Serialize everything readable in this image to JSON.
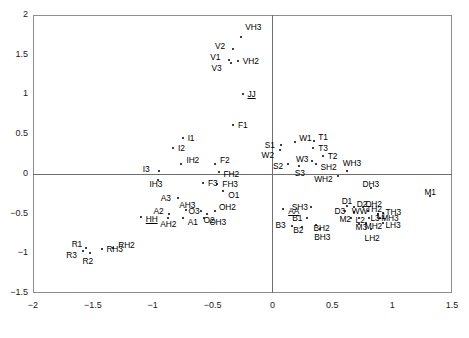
{
  "chart_data": {
    "type": "scatter",
    "title": "",
    "subtitle": "",
    "xlabel": "",
    "ylabel": "",
    "xlim": [
      -2,
      1.5
    ],
    "ylim": [
      -1.5,
      2
    ],
    "grid": false,
    "legend": "none",
    "xticks": [
      "-2",
      "-1.5",
      "-1",
      "-0.5",
      "0",
      "0.5",
      "1",
      "1.5"
    ],
    "xtick_values": [
      -2,
      -1.5,
      -1,
      -0.5,
      0,
      0.5,
      1,
      1.5
    ],
    "yticks": [
      "2",
      "1.5",
      "1",
      "0.5",
      "0",
      "-0.5",
      "-1",
      "-1.5"
    ],
    "ytick_values": [
      2,
      1.5,
      1,
      0.5,
      0,
      -0.5,
      -1,
      -1.5
    ],
    "reference_lines": [
      {
        "axis": "x",
        "value": 0
      },
      {
        "axis": "y",
        "value": 0
      }
    ],
    "marker": "dot",
    "point_color": "#000000",
    "frame_color": "#8d8d8d",
    "points": [
      {
        "label": "VH3",
        "x": -0.26,
        "y": 1.72,
        "lx": 4,
        "ly": -11
      },
      {
        "label": "V2",
        "x": -0.33,
        "y": 1.57,
        "lx": -18,
        "ly": -4
      },
      {
        "label": "V1",
        "x": -0.36,
        "y": 1.43,
        "lx": -19,
        "ly": -4
      },
      {
        "label": "V3",
        "x": -0.35,
        "y": 1.4,
        "lx": -19,
        "ly": 4
      },
      {
        "label": "VH2",
        "x": -0.29,
        "y": 1.42,
        "lx": 5,
        "ly": -1
      },
      {
        "label": "JJ",
        "x": -0.25,
        "y": 1.0,
        "lx": 5,
        "ly": -1,
        "underline": true
      },
      {
        "label": "F1",
        "x": -0.33,
        "y": 0.62,
        "lx": 5,
        "ly": -1
      },
      {
        "label": "I1",
        "x": -0.75,
        "y": 0.45,
        "lx": 5,
        "ly": -1
      },
      {
        "label": "I2",
        "x": -0.83,
        "y": 0.33,
        "lx": 5,
        "ly": -1
      },
      {
        "label": "IH2",
        "x": -0.76,
        "y": 0.12,
        "lx": 5,
        "ly": -5
      },
      {
        "label": "F2",
        "x": -0.48,
        "y": 0.13,
        "lx": 5,
        "ly": -5
      },
      {
        "label": "I3",
        "x": -0.95,
        "y": 0.04,
        "lx": -16,
        "ly": -3
      },
      {
        "label": "FH2",
        "x": -0.45,
        "y": 0.02,
        "lx": 5,
        "ly": 1
      },
      {
        "label": "IH3",
        "x": -0.96,
        "y": -0.08,
        "lx": -8,
        "ly": 3
      },
      {
        "label": "F3",
        "x": -0.58,
        "y": -0.12,
        "lx": 5,
        "ly": -1
      },
      {
        "label": "FH3",
        "x": -0.46,
        "y": -0.13,
        "lx": 5,
        "ly": -1
      },
      {
        "label": "O1",
        "x": -0.41,
        "y": -0.22,
        "lx": 5,
        "ly": 3
      },
      {
        "label": "A3",
        "x": -0.79,
        "y": -0.31,
        "lx": -17,
        "ly": -1
      },
      {
        "label": "AH3",
        "x": -0.72,
        "y": -0.45,
        "lx": -7,
        "ly": -6
      },
      {
        "label": "O3",
        "x": -0.6,
        "y": -0.47,
        "lx": -12,
        "ly": -1
      },
      {
        "label": "O2",
        "x": -0.55,
        "y": -0.5,
        "lx": -3,
        "ly": 5
      },
      {
        "label": "OH2",
        "x": -0.48,
        "y": -0.47,
        "lx": 4,
        "ly": -5
      },
      {
        "label": "A2",
        "x": -0.86,
        "y": -0.5,
        "lx": -16,
        "ly": -4
      },
      {
        "label": "AH2",
        "x": -0.87,
        "y": -0.55,
        "lx": -8,
        "ly": 5
      },
      {
        "label": "A1",
        "x": -0.75,
        "y": -0.55,
        "lx": 5,
        "ly": 3
      },
      {
        "label": "OH3",
        "x": -0.57,
        "y": -0.56,
        "lx": 5,
        "ly": 3
      },
      {
        "label": "HH",
        "x": -1.1,
        "y": -0.54,
        "lx": 5,
        "ly": 1,
        "underline": true
      },
      {
        "label": "R1",
        "x": -1.56,
        "y": -0.93,
        "lx": -14,
        "ly": -5
      },
      {
        "label": "R3",
        "x": -1.58,
        "y": -0.97,
        "lx": -17,
        "ly": 3
      },
      {
        "label": "R2",
        "x": -1.52,
        "y": -1.0,
        "lx": -8,
        "ly": 7
      },
      {
        "label": "RH3",
        "x": -1.42,
        "y": -0.95,
        "lx": 4,
        "ly": -1
      },
      {
        "label": "RH2",
        "x": -1.33,
        "y": -0.93,
        "lx": 5,
        "ly": -4
      },
      {
        "label": "S1",
        "x": 0.07,
        "y": 0.36,
        "lx": -16,
        "ly": -1
      },
      {
        "label": "W2",
        "x": 0.06,
        "y": 0.3,
        "lx": -18,
        "ly": 4
      },
      {
        "label": "W1",
        "x": 0.19,
        "y": 0.4,
        "lx": 4,
        "ly": -5
      },
      {
        "label": "T1",
        "x": 0.35,
        "y": 0.41,
        "lx": 4,
        "ly": -5
      },
      {
        "label": "T3",
        "x": 0.34,
        "y": 0.33,
        "lx": 5,
        "ly": -1
      },
      {
        "label": "T2",
        "x": 0.42,
        "y": 0.22,
        "lx": 5,
        "ly": -1
      },
      {
        "label": "W3",
        "x": 0.33,
        "y": 0.16,
        "lx": -16,
        "ly": -3
      },
      {
        "label": "SH2",
        "x": 0.36,
        "y": 0.12,
        "lx": 5,
        "ly": 2
      },
      {
        "label": "S2",
        "x": 0.13,
        "y": 0.12,
        "lx": -15,
        "ly": 1
      },
      {
        "label": "S3",
        "x": 0.22,
        "y": 0.1,
        "lx": -4,
        "ly": 6
      },
      {
        "label": "WH3",
        "x": 0.62,
        "y": 0.03,
        "lx": -4,
        "ly": -9
      },
      {
        "label": "WH2",
        "x": 0.55,
        "y": -0.03,
        "lx": -24,
        "ly": 2
      },
      {
        "label": "DH3",
        "x": 0.82,
        "y": -0.18,
        "lx": -8,
        "ly": -5
      },
      {
        "label": "M1",
        "x": 1.32,
        "y": -0.28,
        "lx": -6,
        "ly": -5
      },
      {
        "label": "AA",
        "x": 0.09,
        "y": -0.44,
        "lx": 5,
        "ly": 1,
        "underline": true
      },
      {
        "label": "SH3",
        "x": 0.32,
        "y": -0.42,
        "lx": -19,
        "ly": -1
      },
      {
        "label": "D1",
        "x": 0.62,
        "y": -0.41,
        "lx": -5,
        "ly": -6
      },
      {
        "label": "D2",
        "x": 0.68,
        "y": -0.42,
        "lx": 3,
        "ly": -4
      },
      {
        "label": "DH2",
        "x": 0.76,
        "y": -0.42,
        "lx": 2,
        "ly": -4
      },
      {
        "label": "D3",
        "x": 0.61,
        "y": -0.47,
        "lx": -11,
        "ly": -1
      },
      {
        "label": "WW",
        "x": 0.68,
        "y": -0.48,
        "lx": -2,
        "ly": -2
      },
      {
        "label": "TH2",
        "x": 0.8,
        "y": -0.47,
        "lx": -2,
        "ly": -3
      },
      {
        "label": "L1",
        "x": 0.88,
        "y": -0.5,
        "lx": -1,
        "ly": 1
      },
      {
        "label": "TH3",
        "x": 0.92,
        "y": -0.49,
        "lx": 3,
        "ly": -2
      },
      {
        "label": "B1",
        "x": 0.29,
        "y": -0.56,
        "lx": -15,
        "ly": -1
      },
      {
        "label": "M2",
        "x": 0.66,
        "y": -0.56,
        "lx": -12,
        "ly": 0
      },
      {
        "label": "L2",
        "x": 0.72,
        "y": -0.55,
        "lx": -3,
        "ly": 1
      },
      {
        "label": "L3",
        "x": 0.81,
        "y": -0.55,
        "lx": 1,
        "ly": -1
      },
      {
        "label": "MH3",
        "x": 0.9,
        "y": -0.56,
        "lx": 1,
        "ly": -1
      },
      {
        "label": "B3",
        "x": 0.16,
        "y": -0.66,
        "lx": -16,
        "ly": -2
      },
      {
        "label": "B2",
        "x": 0.25,
        "y": -0.67,
        "lx": -9,
        "ly": 2
      },
      {
        "label": "BH2",
        "x": 0.36,
        "y": -0.65,
        "lx": -2,
        "ly": 2
      },
      {
        "label": "M3",
        "x": 0.72,
        "y": -0.63,
        "lx": -3,
        "ly": 2
      },
      {
        "label": "MH2",
        "x": 0.78,
        "y": -0.62,
        "lx": -1,
        "ly": 2
      },
      {
        "label": "LH3",
        "x": 0.92,
        "y": -0.62,
        "lx": 3,
        "ly": 1
      },
      {
        "label": "BH3",
        "x": 0.4,
        "y": -0.7,
        "lx": -6,
        "ly": 7
      },
      {
        "label": "LH2",
        "x": 0.82,
        "y": -0.7,
        "lx": -6,
        "ly": 8
      }
    ]
  }
}
